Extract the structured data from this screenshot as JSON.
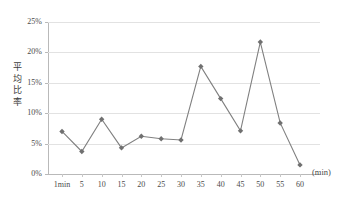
{
  "chart_data": {
    "type": "line",
    "title": "",
    "xlabel": "(min)",
    "ylabel": "平均比率",
    "categories": [
      "1min",
      "5",
      "10",
      "15",
      "20",
      "25",
      "30",
      "35",
      "40",
      "45",
      "50",
      "55",
      "60"
    ],
    "values": [
      7.0,
      3.7,
      9.0,
      4.3,
      6.2,
      5.8,
      5.6,
      17.7,
      12.4,
      7.1,
      21.7,
      8.4,
      1.5
    ],
    "series": [
      {
        "name": "平均比率",
        "values": [
          7.0,
          3.7,
          9.0,
          4.3,
          6.2,
          5.8,
          5.6,
          17.7,
          12.4,
          7.1,
          21.7,
          8.4,
          1.5
        ]
      }
    ],
    "ylim": [
      0,
      25
    ],
    "ytick_labels": [
      "0%",
      "5%",
      "10%",
      "15%",
      "20%",
      "25%"
    ],
    "ytick_values": [
      0,
      5,
      10,
      15,
      20,
      25
    ],
    "grid": true,
    "legend": "none",
    "marker": "diamond",
    "line_color": "#808080",
    "marker_color": "#707070",
    "grid_color": "#e2e2e2",
    "axis_color": "#b9b9b9"
  },
  "axis": {
    "y_title_chars": [
      "平",
      "均",
      "比",
      "率"
    ],
    "x_unit": "(min)"
  }
}
